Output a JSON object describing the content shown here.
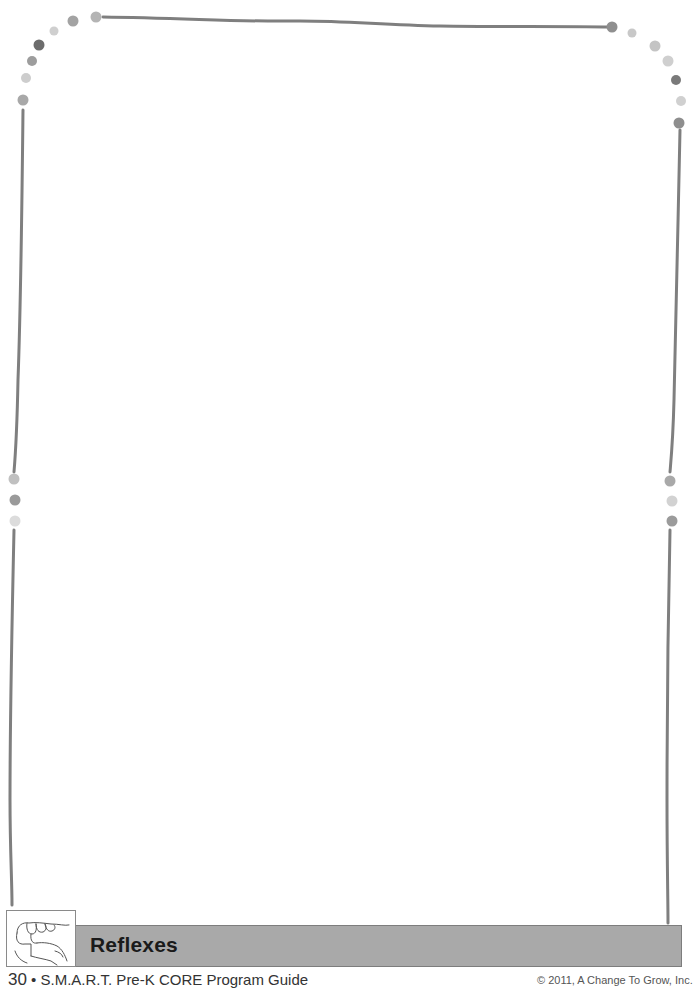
{
  "section": {
    "title": "Reflexes",
    "icon": "hand-gesture-icon"
  },
  "footer": {
    "page_number": "30",
    "separator": "•",
    "guide_title": "S.M.A.R.T. Pre-K CORE Program Guide",
    "copyright": "© 2011, A Change To Grow, Inc."
  },
  "border": {
    "line_color": "#7a7a7a",
    "dot_colors": [
      "#a0a0a0",
      "#c4c4c4",
      "#6a6a6a",
      "#8e8e8e"
    ]
  }
}
